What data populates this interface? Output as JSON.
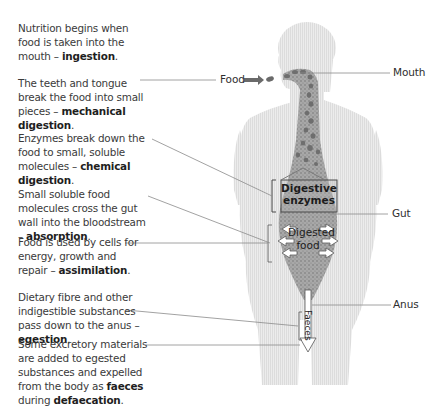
{
  "diagram": {
    "paragraphs": [
      {
        "text": "Nutrition begins when food is taken into the mouth – ",
        "term": "ingestion",
        "tail": "."
      },
      {
        "text": "The teeth and tongue break the food into small pieces – ",
        "term": "mechanical digestion",
        "tail": "."
      },
      {
        "text": "Enzymes break down the food to small, soluble molecules – ",
        "term": "chemical digestion",
        "tail": "."
      },
      {
        "text": "Small soluble food molecules cross the gut wall into the bloodstream – ",
        "term": "absorption",
        "tail": "."
      },
      {
        "text": "Food is used by cells for energy, growth and repair – ",
        "term": "assimilation",
        "tail": "."
      },
      {
        "text": "Dietary fibre and other indigestible substances pass down to the anus – ",
        "term": "egestion",
        "tail": "."
      },
      {
        "text": "Some excretory materials are added to egested substances and expelled from the body as ",
        "term": "faeces",
        "mid": " during ",
        "term2": "defaecation",
        "tail": "."
      }
    ],
    "labels": {
      "food": "Food",
      "mouth": "Mouth",
      "gut": "Gut",
      "anus": "Anus",
      "digestive_enzymes_1": "Digestive",
      "digestive_enzymes_2": "enzymes",
      "digested_food_1": "Digested",
      "digested_food_2": "food",
      "faeces": "Faeces"
    },
    "colors": {
      "body": "#e6e6e6",
      "gut": "#9a9a9a",
      "food_particles": "#6e6e6e",
      "leader_lines": "#7a7a7a",
      "text": "#333333"
    }
  }
}
